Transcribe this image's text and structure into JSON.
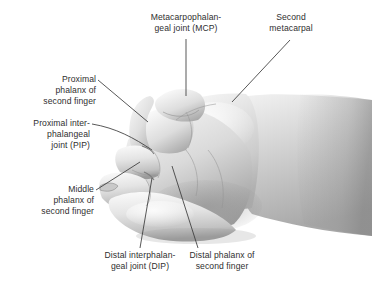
{
  "figure": {
    "illustration_style": "grayscale-anatomical-drawing",
    "background_color": "#ffffff",
    "text_color": "#2f2f2f",
    "leader_line_color": "#3a3a3a"
  },
  "labels": {
    "mcp_joint": "Metacarpophalan-\ngeal joint (MCP)",
    "second_metacarpal": "Second\nmetacarpal",
    "proximal_phalanx": "Proximal\nphalanx of\nsecond finger",
    "pip_joint": "Proximal inter-\nphalangeal\njoint (PIP)",
    "middle_phalanx": "Middle\nphalanx of\nsecond finger",
    "dip_joint": "Distal interphalan-\ngeal joint (DIP)",
    "distal_phalanx": "Distal phalanx of\nsecond finger"
  }
}
